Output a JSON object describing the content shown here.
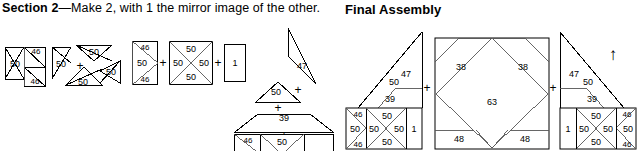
{
  "section": {
    "heading_bold": "Section 2",
    "heading_rest": "—Make 2, with 1 the mirror image of the other."
  },
  "final": {
    "heading": "Final Assembly",
    "arrow_icon": "up-arrow",
    "plus_left": "+",
    "plus_right": "+"
  },
  "piece_numbers": {
    "p46": "46",
    "p50": "50",
    "p47": "47",
    "p39": "39",
    "p38": "38",
    "p63": "63",
    "p48": "48",
    "p22": "22",
    "p1": "1"
  },
  "operators": {
    "plus": "+"
  },
  "section_steps": {
    "step1": {
      "name": "half-square-triangle-unit",
      "labels": [
        "46",
        "50",
        "46"
      ]
    },
    "step2": {
      "name": "pinwheel-unit",
      "labels": [
        "50",
        "50",
        "50",
        "50"
      ],
      "operator": "+"
    },
    "step3": {
      "name": "row-assembly",
      "unit_a": [
        "46",
        "50",
        "46"
      ],
      "unit_b": [
        "50",
        "50",
        "50",
        "50"
      ],
      "unit_c": [
        "1"
      ],
      "operators": [
        "+",
        "+"
      ]
    },
    "step4": {
      "name": "section-stack",
      "top_triangle": "47",
      "small_triangle": "50",
      "trapezoid": "39",
      "bottom_row": [
        "46",
        "50",
        "46",
        "50",
        "50",
        "50",
        "50",
        "1"
      ],
      "operators": [
        "+",
        "+",
        "+"
      ]
    }
  },
  "final_assembly": {
    "left_unit": {
      "name": "section-2-left",
      "top_triangle": "47",
      "small_triangle": "50",
      "trapezoid": "39",
      "bottom_row": [
        "46",
        "50",
        "46",
        "50",
        "50",
        "50",
        "50",
        "1"
      ]
    },
    "center_unit": {
      "name": "center-medallion",
      "corner_top_left": "38",
      "corner_top_right": "38",
      "center_diamond": "63",
      "corner_bottom_left": "48",
      "corner_bottom_right": "48",
      "bottom_row": [
        "22",
        "50",
        "22"
      ]
    },
    "right_unit": {
      "name": "section-2-right-mirror",
      "top_triangle": "47",
      "small_triangle": "50",
      "trapezoid": "39",
      "bottom_row": [
        "1",
        "50",
        "50",
        "50",
        "50",
        "46",
        "50",
        "46"
      ]
    }
  },
  "colors": {
    "ink": "#000000",
    "line_light": "#555555",
    "background": "#ffffff"
  }
}
